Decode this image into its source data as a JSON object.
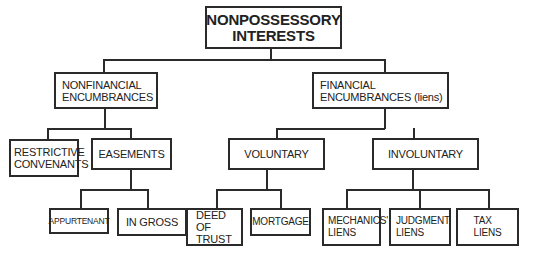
{
  "diagram": {
    "type": "hierarchy-tree",
    "root": {
      "label": "NONPOSSESSORY\nINTERESTS",
      "children": [
        "nonfinancial",
        "financial"
      ]
    },
    "nodes": {
      "nonfinancial": {
        "label": "NONFINANCIAL\nENCUMBRANCES",
        "children": [
          "restrictive_covenants",
          "easements"
        ]
      },
      "financial": {
        "label": "FINANCIAL\nENCUMBRANCES (liens)",
        "children": [
          "voluntary",
          "involuntary"
        ]
      },
      "restrictive_covenants": {
        "label": "RESTRICTIVE\nCONVENANTS",
        "children": []
      },
      "easements": {
        "label": "EASEMENTS",
        "children": [
          "appurtenant",
          "in_gross"
        ]
      },
      "voluntary": {
        "label": "VOLUNTARY",
        "children": [
          "deed_of_trust",
          "mortgage"
        ]
      },
      "involuntary": {
        "label": "INVOLUNTARY",
        "children": [
          "mechanics_liens",
          "judgment_liens",
          "tax_liens"
        ]
      },
      "appurtenant": {
        "label": "APPURTENANT",
        "children": []
      },
      "in_gross": {
        "label": "IN GROSS",
        "children": []
      },
      "deed_of_trust": {
        "label": "DEED OF\nTRUST",
        "children": []
      },
      "mortgage": {
        "label": "MORTGAGE",
        "children": []
      },
      "mechanics_liens": {
        "label": "MECHANICS'\nLIENS",
        "children": []
      },
      "judgment_liens": {
        "label": "JUDGMENT\nLIENS",
        "children": []
      },
      "tax_liens": {
        "label": "TAX\nLIENS",
        "children": []
      }
    }
  }
}
